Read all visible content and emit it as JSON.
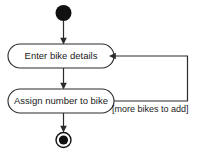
{
  "diagram": {
    "type": "uml-activity-diagram",
    "canvas": {
      "width": 199,
      "height": 155,
      "background": "#ffffff"
    },
    "colors": {
      "stroke": "#2b2b2b",
      "node_fill": "#111111",
      "shape_fill": "#ffffff",
      "text": "#1a1a1a"
    },
    "nodes": {
      "initial": {
        "name": "initial-node",
        "kind": "initial",
        "cx": 63.5,
        "cy": 13,
        "r": 8
      },
      "action_one": {
        "name": "action-enter-bike-details",
        "kind": "action",
        "label": "Enter bike details",
        "x": 8,
        "y": 44,
        "width": 106,
        "height": 24,
        "rx": 12
      },
      "action_two": {
        "name": "action-assign-number-to-bike",
        "kind": "action",
        "label": "Assign number to bike",
        "x": 8,
        "y": 89,
        "width": 106,
        "height": 24,
        "rx": 12
      },
      "final": {
        "name": "final-node",
        "kind": "final",
        "cx": 63.5,
        "cy": 140,
        "r_outer": 7.5,
        "r_inner": 4.6
      }
    },
    "edges": {
      "initial_to_action_one": {
        "name": "flow-initial-to-enter-details",
        "label": ""
      },
      "action_one_to_action_two": {
        "name": "flow-enter-details-to-assign-number",
        "label": ""
      },
      "action_two_to_final": {
        "name": "flow-assign-number-to-final",
        "label": ""
      },
      "loop_back": {
        "name": "flow-loop-back-to-enter-details",
        "label": "[more bikes to add]"
      }
    }
  }
}
